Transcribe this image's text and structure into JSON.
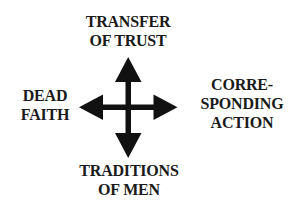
{
  "diagram": {
    "type": "four-way-arrow",
    "arrow_color": "#111111",
    "text_color": "#1a1a1a",
    "labels": {
      "top": {
        "line1": "TRANSFER",
        "line2": "OF TRUST"
      },
      "left": {
        "line1": "DEAD",
        "line2": "FAITH"
      },
      "right": {
        "line1": "CORRE-",
        "line2": "SPONDING",
        "line3": "ACTION"
      },
      "bottom": {
        "line1": "TRADITIONS",
        "line2": "OF MEN"
      }
    },
    "icons": {
      "center": "four-way-arrow-icon"
    }
  }
}
